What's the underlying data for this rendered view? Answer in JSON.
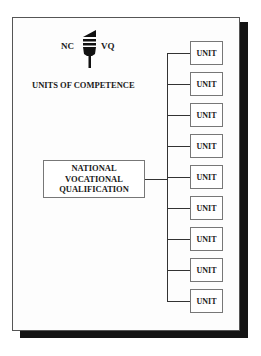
{
  "logo": {
    "left_text": "NC",
    "right_text": "VQ",
    "icon": "torch-icon"
  },
  "heading": "UNITS OF COMPETENCE",
  "qualification": {
    "lines": [
      "NATIONAL",
      "VOCATIONAL",
      "QUALIFICATION"
    ]
  },
  "units": [
    {
      "label": "UNIT"
    },
    {
      "label": "UNIT"
    },
    {
      "label": "UNIT"
    },
    {
      "label": "UNIT"
    },
    {
      "label": "UNIT"
    },
    {
      "label": "UNIT"
    },
    {
      "label": "UNIT"
    },
    {
      "label": "UNIT"
    },
    {
      "label": "UNIT"
    }
  ],
  "colors": {
    "frame_border": "#555555",
    "shadow": "#141414",
    "line": "#333333",
    "background": "#ffffff"
  }
}
